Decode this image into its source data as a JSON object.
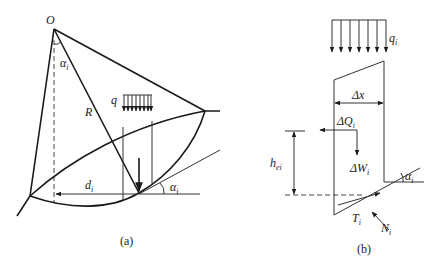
{
  "figure_a": {
    "caption": "(a)",
    "labels": {
      "center": "O",
      "angle_at_center": "α",
      "angle_at_center_sub": "i",
      "radius": "R",
      "load": "q",
      "distance": "d",
      "distance_sub": "i",
      "base_angle": "α",
      "base_angle_sub": "i"
    }
  },
  "figure_b": {
    "caption": "(b)",
    "labels": {
      "load": "q",
      "load_sub": "i",
      "width": "Δx",
      "horizontal_force": "ΔQ",
      "horizontal_force_sub": "i",
      "height": "h",
      "height_sub": "ei",
      "weight": "ΔW",
      "weight_sub": "i",
      "base_angle": "α",
      "base_angle_sub": "i",
      "shear_force": "T",
      "shear_force_sub": "i",
      "normal_force": "N",
      "normal_force_sub": "i"
    }
  }
}
